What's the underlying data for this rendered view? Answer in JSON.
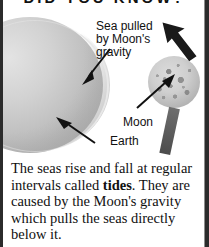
{
  "banner": {
    "title": "DID YOU KNOW?"
  },
  "figure": {
    "labels": {
      "sea_pulled": "Sea pulled\nby Moon's\ngravity",
      "earth": "Earth",
      "moon": "Moon"
    },
    "icons": {
      "pull_arrow": "bold-arrow-icon",
      "sea_leader": "leader-arrow-icon",
      "earth_leader": "leader-arrow-icon",
      "moon_leader": "leader-arrow-icon"
    },
    "objects": {
      "earth": "earth-sphere",
      "sea_bulge": "sea-bulge-layer",
      "moon": "moon-sphere",
      "moon_bar": "shadow-bar"
    }
  },
  "body": {
    "line1": "The seas rise and fall at",
    "line2a": "regular intervals called ",
    "line2b": "tides",
    "line2c": ".",
    "line3": "They are caused by the",
    "line4": "Moon's gravity which pulls",
    "line5": "the seas directly below it."
  },
  "colors": {
    "page_background": "#ffffff",
    "frame_rule": "#2b2b2b",
    "text": "#101010",
    "sphere_light": "#dcdcdc",
    "sphere_dark": "#8c8c8c",
    "arrow": "#1a1a1a"
  }
}
